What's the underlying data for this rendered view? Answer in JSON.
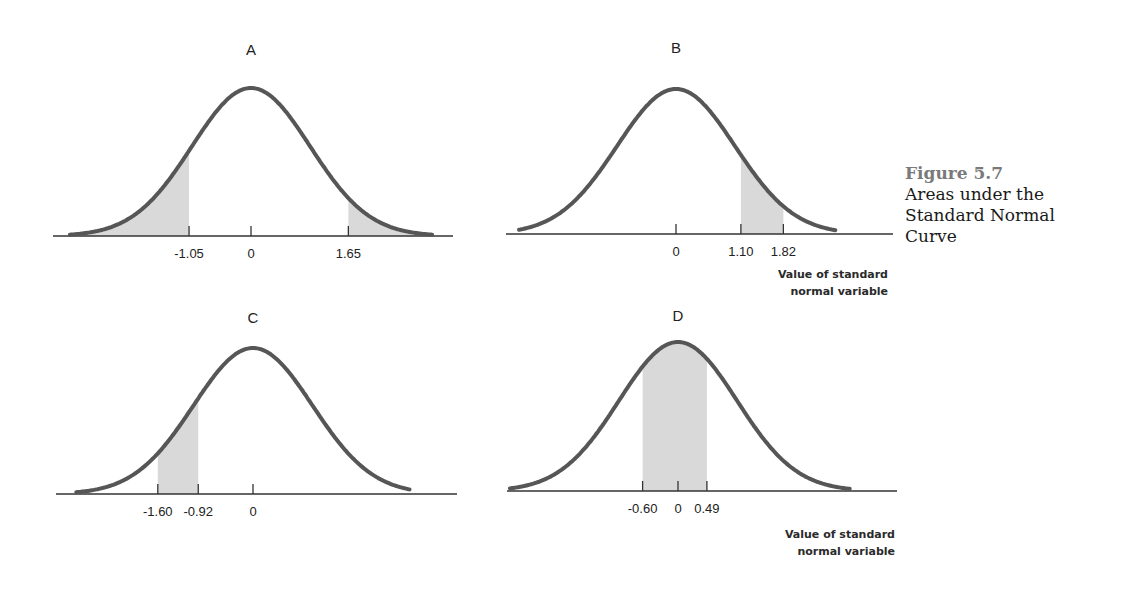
{
  "caption": {
    "figure_number": "Figure 5.7",
    "lines": [
      "Areas under the",
      "Standard Normal",
      "Curve"
    ]
  },
  "axis_note": {
    "line1": "Value of standard",
    "line2": "normal variable"
  },
  "colors": {
    "curve": "#565656",
    "shade": "#d9d9d9",
    "axis": "#333333",
    "caption_number": "#7a7a7a"
  },
  "chart_data": [
    {
      "type": "area",
      "title": "A",
      "description": "Standard normal curve with both tails shaded",
      "xlabel": "",
      "ylabel": "",
      "tick_labels": [
        "-1.05",
        "0",
        "1.65"
      ],
      "ticks": [
        -1.05,
        0,
        1.65
      ],
      "shaded_regions": [
        [
          -3.1,
          -1.05
        ],
        [
          1.65,
          3.1
        ]
      ],
      "layout": {
        "cx": 251,
        "scale": 59,
        "base": 236,
        "peak": 148,
        "axis_x": [
          53,
          453
        ],
        "curve_z": [
          -3.07,
          3.08
        ],
        "letter_y": 55,
        "label_y": 258
      }
    },
    {
      "type": "area",
      "title": "B",
      "description": "Standard normal curve with area between 1.10 and 1.82 shaded",
      "xlabel": "Value of standard normal variable",
      "ylabel": "",
      "tick_labels": [
        "0",
        "1.10",
        "1.82"
      ],
      "ticks": [
        0,
        1.1,
        1.82
      ],
      "shaded_regions": [
        [
          1.1,
          1.82
        ]
      ],
      "layout": {
        "cx": 676,
        "scale": 59,
        "base": 234,
        "peak": 145,
        "axis_x": [
          506,
          893
        ],
        "curve_z": [
          -2.66,
          2.7
        ],
        "letter_y": 53,
        "label_y": 256
      }
    },
    {
      "type": "area",
      "title": "C",
      "description": "Standard normal curve with area between -1.60 and -0.92 shaded",
      "xlabel": "",
      "ylabel": "",
      "tick_labels": [
        "-1.60",
        "-0.92",
        "0"
      ],
      "ticks": [
        -1.6,
        -0.92,
        0
      ],
      "shaded_regions": [
        [
          -1.6,
          -0.92
        ]
      ],
      "layout": {
        "cx": 253,
        "scale": 59.5,
        "base": 494,
        "peak": 146,
        "axis_x": [
          56,
          457
        ],
        "curve_z": [
          -2.97,
          2.64
        ],
        "letter_y": 323,
        "label_y": 516
      }
    },
    {
      "type": "area",
      "title": "D",
      "description": "Standard normal curve with area between -0.60 and 0.49 shaded",
      "xlabel": "Value of standard normal variable",
      "ylabel": "",
      "tick_labels": [
        "-0.60",
        "0",
        "0.49"
      ],
      "ticks": [
        -0.6,
        0,
        0.49
      ],
      "shaded_regions": [
        [
          -0.6,
          0.49
        ]
      ],
      "layout": {
        "cx": 678,
        "scale": 59,
        "base": 491,
        "peak": 149,
        "axis_x": [
          507,
          897
        ],
        "curve_z": [
          -2.85,
          2.92
        ],
        "letter_y": 321,
        "label_y": 513
      }
    }
  ]
}
